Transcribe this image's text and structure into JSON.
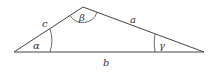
{
  "diagram": {
    "type": "triangle",
    "vertices": {
      "A": {
        "x": 14,
        "y": 52
      },
      "B": {
        "x": 83,
        "y": 7
      },
      "C": {
        "x": 204,
        "y": 52
      }
    },
    "sides": [
      {
        "name": "c",
        "label": "c",
        "x": 42,
        "y": 27
      },
      {
        "name": "a",
        "label": "a",
        "x": 130,
        "y": 23
      },
      {
        "name": "b",
        "label": "b",
        "x": 105,
        "y": 66
      }
    ],
    "angles": [
      {
        "name": "alpha",
        "label": "α",
        "x": 35,
        "y": 48
      },
      {
        "name": "beta",
        "label": "β",
        "x": 80,
        "y": 21
      },
      {
        "name": "gamma",
        "label": "γ",
        "x": 160,
        "y": 48
      }
    ],
    "stroke_color": "#444444"
  }
}
